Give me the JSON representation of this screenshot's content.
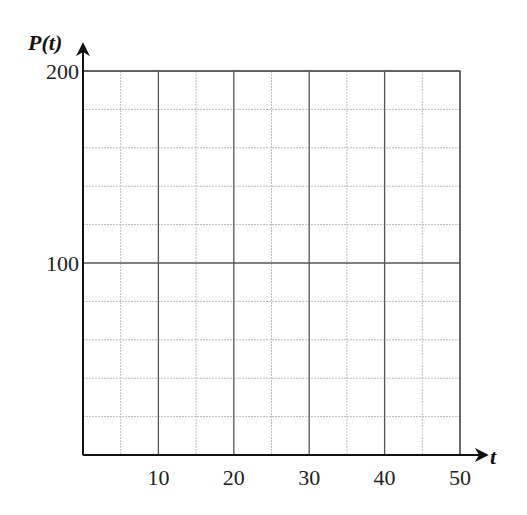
{
  "chart_data": {
    "type": "line",
    "title": "",
    "xlabel": "t",
    "ylabel": "P(t)",
    "xlim": [
      0,
      50
    ],
    "ylim": [
      0,
      200
    ],
    "x_ticks": [
      10,
      20,
      30,
      40,
      50
    ],
    "x_tick_labels": [
      "10",
      "20",
      "30",
      "40",
      "50"
    ],
    "y_ticks": [
      100,
      200
    ],
    "y_tick_labels": [
      "100",
      "200"
    ],
    "x_major_step": 10,
    "x_minor_step": 5,
    "y_major_step": 100,
    "y_minor_step": 20,
    "grid": true,
    "series": [],
    "legend": null
  },
  "layout": {
    "plot_left": 83,
    "plot_right": 460,
    "plot_top": 71,
    "plot_bottom": 455,
    "x_arrow_end": 486,
    "y_arrow_end": 45,
    "colors": {
      "axis": "#111111",
      "major_grid": "#555555",
      "minor_grid": "#bdbdbd",
      "background": "#ffffff"
    }
  }
}
